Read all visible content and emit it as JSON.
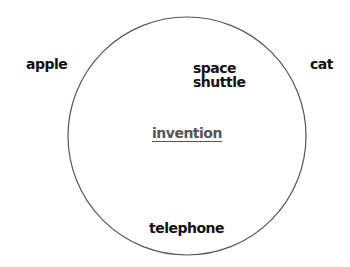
{
  "diagram": {
    "type": "concept-circle",
    "circle": {
      "cx": 187,
      "cy": 136,
      "r": 119,
      "stroke": "#555555",
      "stroke_width": 1.2
    },
    "center_concept": {
      "label": "invention",
      "color": "#555555",
      "underlined": true
    },
    "inside_circle": [
      {
        "id": "space-shuttle",
        "lines": [
          "space",
          "shuttle"
        ]
      },
      {
        "id": "telephone",
        "lines": [
          "telephone"
        ]
      }
    ],
    "outside_circle": [
      {
        "id": "apple",
        "label": "apple"
      },
      {
        "id": "cat",
        "label": "cat"
      }
    ],
    "text_color": "#111111"
  }
}
